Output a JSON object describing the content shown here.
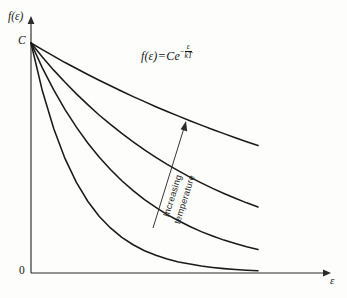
{
  "figure": {
    "background_color": "#fdfdfb",
    "ink_color": "#1a1a1a"
  },
  "labels": {
    "y_axis": "f(ε)",
    "x_axis": "ε",
    "origin": "0",
    "intercept": "C"
  },
  "equation": {
    "lhs": "f(ε)",
    "operator": "=",
    "base": "Ce",
    "exponent_sign": "−",
    "exponent_numerator": "ε",
    "exponent_denominator": "kT",
    "full_text": "f(ε) = Ce^(−ε/kT)"
  },
  "annotation": {
    "line1": "Increasing",
    "line2": "temperature",
    "arrow_direction": "up-right",
    "arrow_from": [
      153,
      228
    ],
    "arrow_to": [
      186,
      122
    ]
  },
  "chart_data": {
    "type": "line",
    "title": "",
    "subtitle": "",
    "xlabel": "ε",
    "ylabel": "f(ε)",
    "grid": false,
    "legend_position": "none",
    "annotations": [
      {
        "text": "f(ε) = Ce^(−ε/kT)",
        "x_px": 141,
        "y_px": 44
      },
      {
        "text": "Increasing temperature",
        "x_px": 165,
        "y_px": 175,
        "rotation_deg": -72.5,
        "arrow": true
      }
    ],
    "axis_notes": {
      "x_axis_ticks": [],
      "y_axis_ticks": [
        "0",
        "C"
      ],
      "x_range_label": "0 to ε (unbounded, arrow)",
      "y_range_label": "0 to C (arrow)",
      "description": "Maxwell-Boltzmann exponential distribution f(ε)=Ce^(-ε/kT) drawn for four increasing temperatures; all curves share the intercept C at ε=0 and decay toward 0."
    },
    "x": [
      0,
      0.05,
      0.1,
      0.15,
      0.2,
      0.25,
      0.3,
      0.35,
      0.4,
      0.45,
      0.5,
      0.55,
      0.6,
      0.65,
      0.7,
      0.75,
      0.8,
      0.85,
      0.9,
      0.95,
      1.0
    ],
    "series": [
      {
        "name": "T1 (lowest temperature)",
        "decay_constant_kT": 0.215,
        "values": [
          1.0,
          0.792,
          0.628,
          0.497,
          0.394,
          0.312,
          0.247,
          0.196,
          0.155,
          0.123,
          0.097,
          0.077,
          0.061,
          0.048,
          0.039,
          0.03,
          0.024,
          0.019,
          0.015,
          0.012,
          0.01
        ]
      },
      {
        "name": "T2",
        "decay_constant_kT": 0.44,
        "values": [
          1.0,
          0.892,
          0.796,
          0.71,
          0.634,
          0.565,
          0.504,
          0.45,
          0.401,
          0.358,
          0.319,
          0.285,
          0.254,
          0.227,
          0.202,
          0.18,
          0.161,
          0.143,
          0.128,
          0.114,
          0.102
        ]
      },
      {
        "name": "T3",
        "decay_constant_kT": 0.8,
        "values": [
          1.0,
          0.939,
          0.882,
          0.829,
          0.779,
          0.732,
          0.687,
          0.646,
          0.607,
          0.57,
          0.535,
          0.503,
          0.472,
          0.444,
          0.417,
          0.392,
          0.368,
          0.346,
          0.325,
          0.305,
          0.287
        ]
      },
      {
        "name": "T4 (highest temperature)",
        "decay_constant_kT": 1.7,
        "values": [
          1.0,
          0.971,
          0.943,
          0.915,
          0.889,
          0.863,
          0.838,
          0.814,
          0.79,
          0.767,
          0.745,
          0.723,
          0.702,
          0.682,
          0.662,
          0.643,
          0.624,
          0.606,
          0.588,
          0.571,
          0.554
        ]
      }
    ]
  }
}
